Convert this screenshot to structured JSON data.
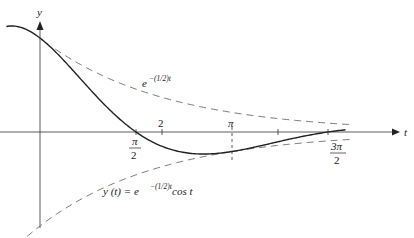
{
  "chart_data": {
    "type": "line",
    "title": "",
    "xlabel": "t",
    "ylabel": "y",
    "xlim": [
      -0.65,
      5.9
    ],
    "ylim": [
      -1.0,
      1.15
    ],
    "grid": false,
    "x_tick_labels": [
      {
        "value": 1.5708,
        "label_num": "π",
        "label_den": "2",
        "position": "below"
      },
      {
        "value": 2,
        "label": "2",
        "position": "above"
      },
      {
        "value": 3.1416,
        "label": "π",
        "position": "above"
      },
      {
        "value": 3.9,
        "label": "",
        "position": "none"
      },
      {
        "value": 4.7124,
        "label_num": "3π",
        "label_den": "2",
        "position": "below"
      }
    ],
    "series": [
      {
        "name": "y(t) = e^{-(1/2)t} cos t",
        "style": "solid",
        "function": "exp(-t/2)*cos(t)",
        "x_range": [
          -0.5,
          5.1
        ]
      },
      {
        "name": "e^{-(1/2)t}",
        "style": "dashed",
        "function": "exp(-t/2)",
        "x_range": [
          -0.5,
          5.1
        ]
      },
      {
        "name": "-e^{-(1/2)t}",
        "style": "dashed",
        "function": "-exp(-t/2)",
        "x_range": [
          -0.5,
          5.1
        ]
      }
    ],
    "annotations": [
      {
        "text_base": "e",
        "text_sup": "−(1/2)t",
        "near": "upper envelope"
      },
      {
        "text": "y(t) = e",
        "text_sup": "−(1/2)t",
        "text_after": " cos t",
        "near": "lower envelope"
      }
    ]
  },
  "labels": {
    "y_axis": "y",
    "t_axis": "t",
    "pi_over_2_num": "π",
    "pi_over_2_den": "2",
    "two": "2",
    "pi": "π",
    "three_pi_over_2_num": "3π",
    "three_pi_over_2_den": "2",
    "upper_env_base": "e",
    "upper_env_sup": "−(1/2)t",
    "formula_pre": "y (t) = e",
    "formula_sup": "−(1/2)t",
    "formula_post": " cos t"
  },
  "colors": {
    "curve": "#222222",
    "envelope": "#555555",
    "axis": "#333333"
  }
}
